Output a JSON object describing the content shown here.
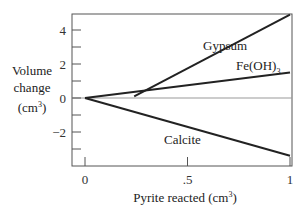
{
  "chart_data": {
    "type": "line",
    "title": "",
    "xlabel": "Pyrite reacted (cm³)",
    "xlabel_main": "Pyrite reacted (cm",
    "xlabel_sup": "3",
    "xlabel_end": ")",
    "ylabel_lines": [
      "Volume",
      "change"
    ],
    "ylabel_unit_main": "(cm",
    "ylabel_unit_sup": "3",
    "ylabel_unit_end": ")",
    "xlim": [
      -0.06,
      1.01
    ],
    "ylim": [
      -4.0,
      5.0
    ],
    "x_ticks": [
      0,
      0.5,
      1
    ],
    "x_tick_labels": [
      "0",
      ".5",
      "1"
    ],
    "y_ticks_major": [
      -2,
      0,
      2,
      4
    ],
    "y_tick_labels": [
      "−2",
      "0",
      "2",
      "4"
    ],
    "y_ticks_minor": [
      -3,
      -1,
      1,
      3
    ],
    "zero_line": true,
    "grid": false,
    "legend": "none",
    "series": [
      {
        "name": "Gypsum",
        "x": [
          0.24,
          1.0
        ],
        "y": [
          0.1,
          4.9
        ]
      },
      {
        "name": "Fe(OH)3",
        "x": [
          0.0,
          1.0
        ],
        "y": [
          0.0,
          1.5
        ]
      },
      {
        "name": "Calcite",
        "x": [
          0.0,
          1.0
        ],
        "y": [
          0.0,
          -3.4
        ]
      }
    ],
    "annotations": [
      {
        "series": "Gypsum",
        "text": "Gypsum"
      },
      {
        "series": "Fe(OH)3",
        "text_main": "Fe(OH)",
        "text_sub": "3"
      },
      {
        "series": "Calcite",
        "text": "Calcite"
      }
    ]
  }
}
